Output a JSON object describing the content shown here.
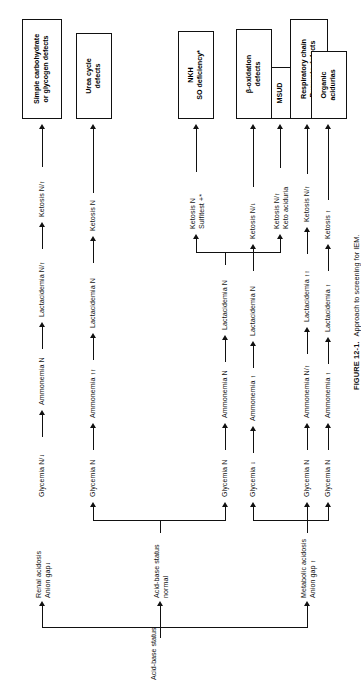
{
  "figure": {
    "number": "FIGURE 12-1.",
    "caption": "Approach to screening for IEM."
  },
  "root": {
    "label": "Acid-base status"
  },
  "branches": [
    {
      "id": "renal",
      "label_line1": "Renal acidosis",
      "label_line2": "Anion gap↓"
    },
    {
      "id": "normal",
      "label_line1": "Acid-base status",
      "label_line2": "normal"
    },
    {
      "id": "metabolic",
      "label_line1": "Metabolic acidosis",
      "label_line2": "Anion gap ↑"
    }
  ],
  "paths": [
    {
      "id": "path-1",
      "branch": "renal",
      "glycemia": "Glycemia N/↓",
      "ammonemia": "Ammonemia N",
      "lactacidemia": "Lactacidemia N/↑",
      "ketosis": "Ketosis N/↑",
      "outcome_line1": "Simple carbohydrate",
      "outcome_line2": "or glycogen defects"
    },
    {
      "id": "path-2",
      "branch": "normal",
      "glycemia": "Glycemia N",
      "ammonemia": "Ammonemia ↑↑",
      "lactacidemia": "Lactacidemia N",
      "ketosis": "Ketosis N",
      "outcome_line1": "Urea cycle",
      "outcome_line2": "defects"
    },
    {
      "id": "path-3a",
      "branch": "normal",
      "glycemia": "Glycemia N",
      "ammonemia": "Ammonemia N",
      "lactacidemia": "Lactacidemia N",
      "ketosis_line1": "Ketosis N",
      "ketosis_line2": "Sulfitest +*",
      "outcome_line1": "NKH",
      "outcome_line2": "SO deficiency*"
    },
    {
      "id": "path-3b",
      "branch": "normal",
      "ketosis_line1": "Ketosis N/↑",
      "ketosis_line2": "Keto aciduria",
      "outcome_line1": "MSUD",
      "outcome_line2": ""
    },
    {
      "id": "path-4",
      "branch": "metabolic",
      "glycemia": "Glycemia ↓",
      "ammonemia": "Ammonemia ↑",
      "lactacidemia": "Lactacidemia N",
      "ketosis": "Ketosis N/↓",
      "outcome_line1": "β-oxidation",
      "outcome_line2": "defects"
    },
    {
      "id": "path-5",
      "branch": "metabolic",
      "glycemia": "Glycemia N",
      "ammonemia": "Ammonemia N/↑",
      "lactacidemia": "Lactacidemia ↑↑",
      "ketosis": "Ketosis N/↑",
      "outcome_line1": "Respiratory chain",
      "outcome_line2": "Pyruvate defects"
    },
    {
      "id": "path-6",
      "branch": "metabolic",
      "glycemia": "Glycemia N",
      "ammonemia": "Ammonemia ↑",
      "lactacidemia": "Lactacidemia ↑",
      "ketosis": "Ketosis ↑",
      "outcome_line1": "Organic",
      "outcome_line2": "acidurias"
    }
  ],
  "colors": {
    "ink": "#111111",
    "paper": "#ffffff"
  }
}
